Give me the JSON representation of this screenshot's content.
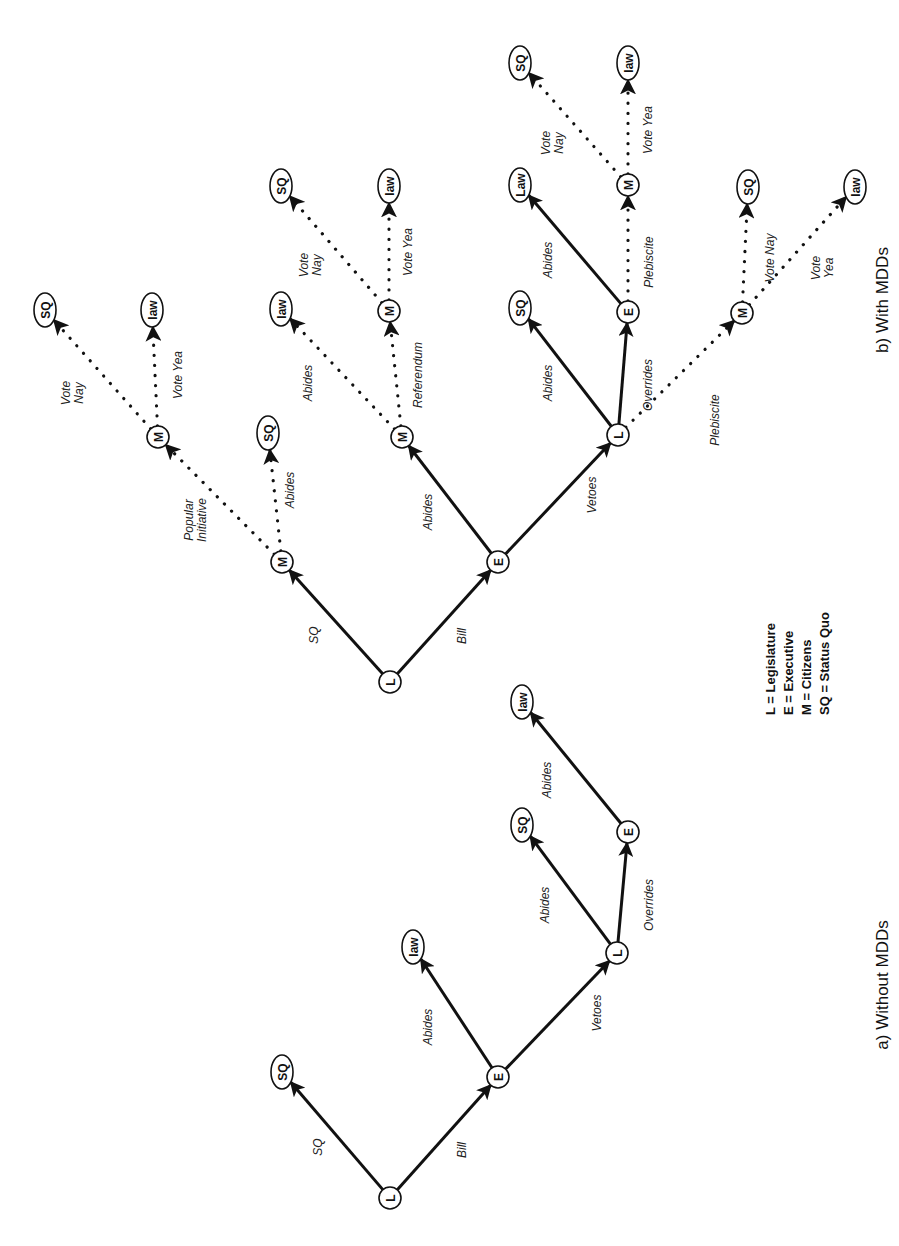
{
  "legend": {
    "items": [
      {
        "key": "L",
        "text": "L = Legislature"
      },
      {
        "key": "E",
        "text": "E = Executive"
      },
      {
        "key": "M",
        "text": "M = Citizens"
      },
      {
        "key": "SQ",
        "text": "SQ = Status Quo"
      }
    ]
  },
  "captions": {
    "a": "a) Without MDDs",
    "b": "b) With MDDs"
  },
  "trees": {
    "a": {
      "title": "a) Without MDDs",
      "nodes": [
        {
          "id": "a_L0",
          "label": "L",
          "x": 390,
          "y": 1198,
          "shape": "circle"
        },
        {
          "id": "a_SQ1",
          "label": "SQ",
          "x": 282,
          "y": 1072,
          "shape": "ellipse"
        },
        {
          "id": "a_E1",
          "label": "E",
          "x": 498,
          "y": 1077,
          "shape": "circle"
        },
        {
          "id": "a_law1",
          "label": "law",
          "x": 413,
          "y": 947,
          "shape": "ellipse"
        },
        {
          "id": "a_L2",
          "label": "L",
          "x": 617,
          "y": 953,
          "shape": "circle"
        },
        {
          "id": "a_SQ2",
          "label": "SQ",
          "x": 522,
          "y": 825,
          "shape": "ellipse"
        },
        {
          "id": "a_E2",
          "label": "E",
          "x": 628,
          "y": 832,
          "shape": "circle"
        },
        {
          "id": "a_law2",
          "label": "law",
          "x": 522,
          "y": 702,
          "shape": "ellipse"
        }
      ],
      "edges": [
        {
          "from": "a_L0",
          "to": "a_SQ1",
          "label": "SQ",
          "style": "solid",
          "lx": 318,
          "ly": 1147
        },
        {
          "from": "a_L0",
          "to": "a_E1",
          "label": "Bill",
          "style": "solid",
          "lx": 462,
          "ly": 1150
        },
        {
          "from": "a_E1",
          "to": "a_law1",
          "label": "Abides",
          "style": "solid",
          "lx": 428,
          "ly": 1027
        },
        {
          "from": "a_E1",
          "to": "a_L2",
          "label": "Vetoes",
          "style": "solid",
          "lx": 597,
          "ly": 1013
        },
        {
          "from": "a_L2",
          "to": "a_SQ2",
          "label": "Abides",
          "style": "solid",
          "lx": 545,
          "ly": 905
        },
        {
          "from": "a_L2",
          "to": "a_E2",
          "label": "Overrides",
          "style": "solid",
          "lx": 649,
          "ly": 905
        },
        {
          "from": "a_E2",
          "to": "a_law2",
          "label": "Abides",
          "style": "solid",
          "lx": 547,
          "ly": 780
        }
      ]
    },
    "b": {
      "title": "b) With MDDs",
      "nodes": [
        {
          "id": "b_L0",
          "label": "L",
          "x": 390,
          "y": 682,
          "shape": "circle"
        },
        {
          "id": "b_M1",
          "label": "M",
          "x": 282,
          "y": 562,
          "shape": "circle"
        },
        {
          "id": "b_SQa",
          "label": "SQ",
          "x": 268,
          "y": 433,
          "shape": "ellipse"
        },
        {
          "id": "b_M2",
          "label": "M",
          "x": 158,
          "y": 437,
          "shape": "circle"
        },
        {
          "id": "b_SQb",
          "label": "SQ",
          "x": 45,
          "y": 310,
          "shape": "ellipse"
        },
        {
          "id": "b_lawb",
          "label": "law",
          "x": 152,
          "y": 310,
          "shape": "ellipse"
        },
        {
          "id": "b_E1",
          "label": "E",
          "x": 498,
          "y": 562,
          "shape": "circle"
        },
        {
          "id": "b_M3",
          "label": "M",
          "x": 402,
          "y": 437,
          "shape": "circle"
        },
        {
          "id": "b_lawc",
          "label": "law",
          "x": 281,
          "y": 309,
          "shape": "ellipse"
        },
        {
          "id": "b_M4",
          "label": "M",
          "x": 389,
          "y": 311,
          "shape": "circle"
        },
        {
          "id": "b_SQd",
          "label": "SQ",
          "x": 281,
          "y": 186,
          "shape": "ellipse"
        },
        {
          "id": "b_lawd",
          "label": "law",
          "x": 389,
          "y": 186,
          "shape": "ellipse"
        },
        {
          "id": "b_L2",
          "label": "L",
          "x": 618,
          "y": 435,
          "shape": "circle"
        },
        {
          "id": "b_SQe",
          "label": "SQ",
          "x": 520,
          "y": 308,
          "shape": "ellipse"
        },
        {
          "id": "b_E2",
          "label": "E",
          "x": 628,
          "y": 312,
          "shape": "circle"
        },
        {
          "id": "b_Lawf",
          "label": "Law",
          "x": 520,
          "y": 185,
          "shape": "ellipse"
        },
        {
          "id": "b_M5",
          "label": "M",
          "x": 628,
          "y": 185,
          "shape": "circle"
        },
        {
          "id": "b_SQg",
          "label": "SQ",
          "x": 520,
          "y": 63,
          "shape": "ellipse"
        },
        {
          "id": "b_lawg",
          "label": "law",
          "x": 628,
          "y": 63,
          "shape": "ellipse"
        },
        {
          "id": "b_M6",
          "label": "M",
          "x": 742,
          "y": 313,
          "shape": "circle"
        },
        {
          "id": "b_SQh",
          "label": "SQ",
          "x": 748,
          "y": 187,
          "shape": "ellipse"
        },
        {
          "id": "b_lawh",
          "label": "law",
          "x": 855,
          "y": 187,
          "shape": "ellipse"
        }
      ],
      "edges": [
        {
          "from": "b_L0",
          "to": "b_M1",
          "label": "SQ",
          "style": "solid",
          "lx": 314,
          "ly": 635
        },
        {
          "from": "b_L0",
          "to": "b_E1",
          "label": "Bill",
          "style": "solid",
          "lx": 462,
          "ly": 636
        },
        {
          "from": "b_M1",
          "to": "b_SQa",
          "label": "Abides",
          "style": "dotted",
          "lx": 290,
          "ly": 490
        },
        {
          "from": "b_M1",
          "to": "b_M2",
          "label": "Popular Initiative",
          "label_lines": [
            "Popular",
            "Initiative"
          ],
          "style": "dotted",
          "lx": 195,
          "ly": 520
        },
        {
          "from": "b_M2",
          "to": "b_SQb",
          "label": "Vote Nay",
          "label_lines": [
            "Vote",
            "Nay"
          ],
          "style": "dotted",
          "lx": 72,
          "ly": 393
        },
        {
          "from": "b_M2",
          "to": "b_lawb",
          "label": "Vote Yea",
          "style": "dotted",
          "lx": 178,
          "ly": 375
        },
        {
          "from": "b_E1",
          "to": "b_M3",
          "label": "Abides",
          "style": "solid",
          "lx": 428,
          "ly": 512
        },
        {
          "from": "b_E1",
          "to": "b_L2",
          "label": "Vetoes",
          "style": "solid",
          "lx": 592,
          "ly": 495
        },
        {
          "from": "b_M3",
          "to": "b_lawc",
          "label": "Abides",
          "style": "dotted",
          "lx": 308,
          "ly": 383
        },
        {
          "from": "b_M3",
          "to": "b_M4",
          "label": "Referendum",
          "style": "dotted",
          "lx": 418,
          "ly": 375
        },
        {
          "from": "b_M4",
          "to": "b_SQd",
          "label": "Vote Nay",
          "label_lines": [
            "Vote",
            "Nay"
          ],
          "style": "dotted",
          "lx": 310,
          "ly": 265
        },
        {
          "from": "b_M4",
          "to": "b_lawd",
          "label": "Vote Yea",
          "style": "dotted",
          "lx": 408,
          "ly": 252
        },
        {
          "from": "b_L2",
          "to": "b_SQe",
          "label": "Abides",
          "style": "solid",
          "lx": 548,
          "ly": 383
        },
        {
          "from": "b_L2",
          "to": "b_E2",
          "label": "Overrides",
          "style": "solid",
          "lx": 648,
          "ly": 385
        },
        {
          "from": "b_L2",
          "to": "b_M6",
          "label": "Plebiscite",
          "style": "dotted",
          "lx": 715,
          "ly": 420
        },
        {
          "from": "b_E2",
          "to": "b_Lawf",
          "label": "Abides",
          "style": "solid",
          "lx": 548,
          "ly": 260
        },
        {
          "from": "b_E2",
          "to": "b_M5",
          "label": "Plebiscite",
          "style": "dotted",
          "lx": 649,
          "ly": 262
        },
        {
          "from": "b_M5",
          "to": "b_SQg",
          "label": "Vote Nay",
          "label_lines": [
            "Vote",
            "Nay"
          ],
          "style": "dotted",
          "lx": 552,
          "ly": 143
        },
        {
          "from": "b_M5",
          "to": "b_lawg",
          "label": "Vote Yea",
          "style": "dotted",
          "lx": 648,
          "ly": 130
        },
        {
          "from": "b_M6",
          "to": "b_SQh",
          "label": "Vote Nay",
          "style": "dotted",
          "lx": 770,
          "ly": 258
        },
        {
          "from": "b_M6",
          "to": "b_lawh",
          "label": "Vote Yea",
          "label_lines": [
            "Vote",
            "Yea"
          ],
          "style": "dotted",
          "lx": 822,
          "ly": 268
        }
      ]
    }
  },
  "layout": {
    "legend_x": 775,
    "legend_y": 715,
    "legend_line_gap": 18,
    "caption_a_x": 888,
    "caption_a_y": 985,
    "caption_b_x": 888,
    "caption_b_y": 300
  }
}
